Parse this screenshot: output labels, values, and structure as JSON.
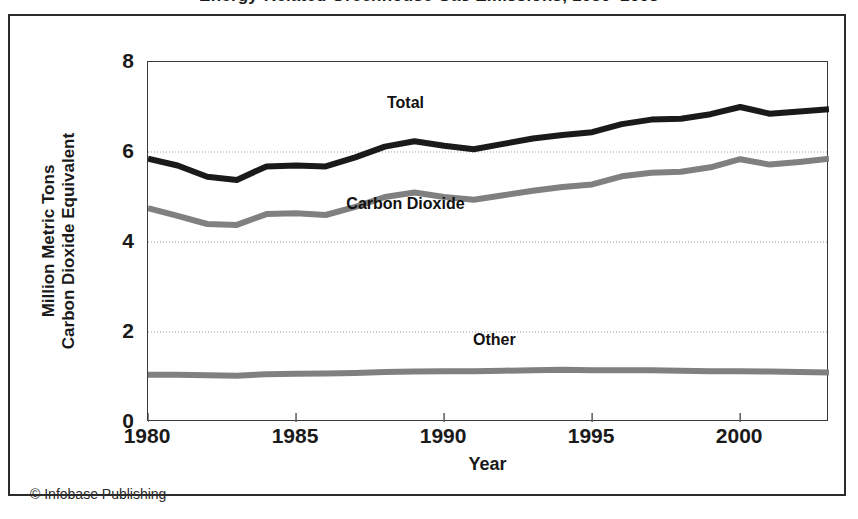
{
  "figure": {
    "title_fragment": "Energy-Related Greenhouse Gas Emissions, 1980–2003",
    "credit": "© Infobase Publishing"
  },
  "chart_data": {
    "type": "line",
    "title": "",
    "xlabel": "Year",
    "ylabel": "Million Metric Tons\nCarbon Dioxide Equivalent",
    "ylabel_line1": "Million Metric Tons",
    "ylabel_line2": "Carbon Dioxide Equivalent",
    "xlim": [
      1980,
      2003
    ],
    "ylim": [
      0,
      8
    ],
    "xticks": [
      1980,
      1985,
      1990,
      1995,
      2000
    ],
    "xtick_labels": [
      "1980",
      "1985",
      "1990",
      "1995",
      "2000"
    ],
    "yticks": [
      0,
      2,
      4,
      6,
      8
    ],
    "ytick_labels": [
      "0",
      "2",
      "4",
      "6",
      "8"
    ],
    "grid": "horizontal-dotted",
    "legend_position": "inline-annotations",
    "x": [
      1980,
      1981,
      1982,
      1983,
      1984,
      1985,
      1986,
      1987,
      1988,
      1989,
      1990,
      1991,
      1992,
      1993,
      1994,
      1995,
      1996,
      1997,
      1998,
      1999,
      2000,
      2001,
      2002,
      2003
    ],
    "series": [
      {
        "name": "Total",
        "color": "#1a1a1a",
        "width": 6,
        "label_x": 1989,
        "label_y": 6.95,
        "values": [
          5.85,
          5.7,
          5.45,
          5.38,
          5.68,
          5.7,
          5.68,
          5.88,
          6.12,
          6.24,
          6.14,
          6.06,
          6.18,
          6.3,
          6.38,
          6.44,
          6.62,
          6.72,
          6.74,
          6.84,
          7.0,
          6.85,
          6.9,
          6.95
        ]
      },
      {
        "name": "Carbon Dioxide",
        "color": "#808080",
        "width": 6,
        "label_x": 1989,
        "label_y": 4.72,
        "values": [
          4.75,
          4.58,
          4.4,
          4.38,
          4.62,
          4.64,
          4.6,
          4.78,
          5.0,
          5.1,
          5.0,
          4.94,
          5.04,
          5.14,
          5.22,
          5.28,
          5.46,
          5.54,
          5.56,
          5.66,
          5.84,
          5.72,
          5.78,
          5.85
        ]
      },
      {
        "name": "Other",
        "color": "#808080",
        "width": 6,
        "label_x": 1992,
        "label_y": 1.7,
        "values": [
          1.05,
          1.05,
          1.04,
          1.03,
          1.06,
          1.07,
          1.08,
          1.09,
          1.11,
          1.12,
          1.13,
          1.13,
          1.14,
          1.15,
          1.16,
          1.15,
          1.15,
          1.15,
          1.14,
          1.13,
          1.13,
          1.12,
          1.11,
          1.1
        ]
      }
    ]
  }
}
